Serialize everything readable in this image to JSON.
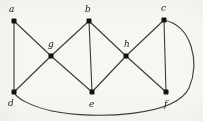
{
  "figure": {
    "kind": "undirected-graph-diagram",
    "width": 203,
    "height": 121,
    "background_color": "#f7f6f3",
    "edge_color": "#3a3a38",
    "vertex_color": "#121210",
    "label_color": "#1a1a18"
  },
  "vertices": [
    {
      "id": "a",
      "label": "a",
      "x": 14,
      "y": 21,
      "label_x": 9,
      "label_y": 5,
      "shape": "square-dot"
    },
    {
      "id": "b",
      "label": "b",
      "x": 89,
      "y": 21,
      "label_x": 85,
      "label_y": 5,
      "shape": "square-dot"
    },
    {
      "id": "c",
      "label": "c",
      "x": 164,
      "y": 20,
      "label_x": 161,
      "label_y": 4,
      "shape": "square-dot"
    },
    {
      "id": "g",
      "label": "g",
      "x": 51,
      "y": 56,
      "label_x": 48,
      "label_y": 40,
      "shape": "square-dot"
    },
    {
      "id": "h",
      "label": "h",
      "x": 126,
      "y": 56,
      "label_x": 124,
      "label_y": 40,
      "shape": "square-dot"
    },
    {
      "id": "d",
      "label": "d",
      "x": 14,
      "y": 92,
      "label_x": 8,
      "label_y": 99,
      "shape": "square-dot"
    },
    {
      "id": "e",
      "label": "e",
      "x": 92,
      "y": 92,
      "label_x": 89,
      "label_y": 100,
      "shape": "square-dot"
    },
    {
      "id": "f",
      "label": "f",
      "x": 166,
      "y": 92,
      "label_x": 164,
      "label_y": 100,
      "shape": "square-dot"
    }
  ],
  "edges": [
    {
      "from": "a",
      "to": "d",
      "type": "straight"
    },
    {
      "from": "a",
      "to": "g",
      "type": "straight"
    },
    {
      "from": "g",
      "to": "d",
      "type": "straight"
    },
    {
      "from": "g",
      "to": "b",
      "type": "straight"
    },
    {
      "from": "g",
      "to": "e",
      "type": "straight"
    },
    {
      "from": "b",
      "to": "e",
      "type": "straight"
    },
    {
      "from": "b",
      "to": "h",
      "type": "straight"
    },
    {
      "from": "h",
      "to": "e",
      "type": "straight"
    },
    {
      "from": "h",
      "to": "c",
      "type": "straight"
    },
    {
      "from": "h",
      "to": "f",
      "type": "straight"
    },
    {
      "from": "c",
      "to": "f",
      "type": "straight"
    },
    {
      "from": "c",
      "to": "d",
      "type": "curved",
      "path": "M 164 20 C 192 26, 200 62, 189 88 C 176 116, 96 120, 52 111 C 30 106, 16 98, 14 92"
    }
  ],
  "vertex_marker": {
    "size": 5,
    "radius": 1
  }
}
